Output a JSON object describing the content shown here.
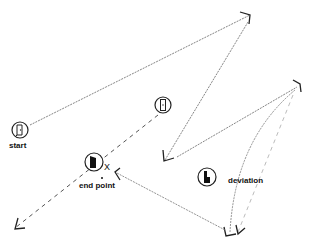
{
  "labels": {
    "start": "start",
    "end_point": "end point",
    "deviation": "deviation",
    "end_marker": "X"
  },
  "icons": {
    "start": "door-closed-icon",
    "waypoint": "door-closed-icon",
    "end_point": "door-open-icon",
    "deviation": "door-deviation-icon"
  },
  "colors": {
    "line": "#555555",
    "faint_line": "#9a9a9a",
    "ink": "#111111"
  }
}
